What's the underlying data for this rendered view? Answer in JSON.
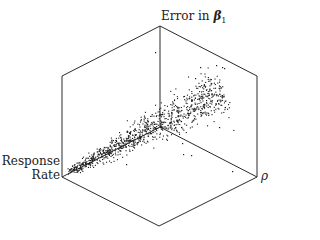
{
  "chart_data": {
    "type": "scatter",
    "projection": "3d-isometric-box",
    "title": "",
    "axes": {
      "z_label_main": "Error in ",
      "z_label_symbol": "β",
      "z_label_sub": "1",
      "x_label_line1": "Response",
      "x_label_line2": "Rate",
      "y_label": "ρ"
    },
    "grid": false,
    "legend": null,
    "box": {
      "top": [
        160,
        26
      ],
      "upper_left": [
        62,
        76
      ],
      "upper_right": [
        257,
        76
      ],
      "center": [
        160,
        127
      ],
      "lower_left": [
        62,
        177
      ],
      "lower_right": [
        257,
        177
      ],
      "bottom": [
        159,
        226
      ]
    },
    "cluster": {
      "n_points": 1000,
      "start": [
        68,
        172
      ],
      "end": [
        222,
        90
      ],
      "spread_start": 4,
      "spread_end": 22,
      "seed": 7
    },
    "outliers": [
      [
        155,
        52
      ],
      [
        216,
        65
      ],
      [
        222,
        67
      ],
      [
        224,
        68
      ],
      [
        200,
        67
      ],
      [
        232,
        171
      ],
      [
        183,
        154
      ],
      [
        191,
        155
      ],
      [
        126,
        164
      ],
      [
        182,
        143
      ],
      [
        219,
        127
      ],
      [
        206,
        100
      ],
      [
        195,
        78
      ]
    ]
  }
}
